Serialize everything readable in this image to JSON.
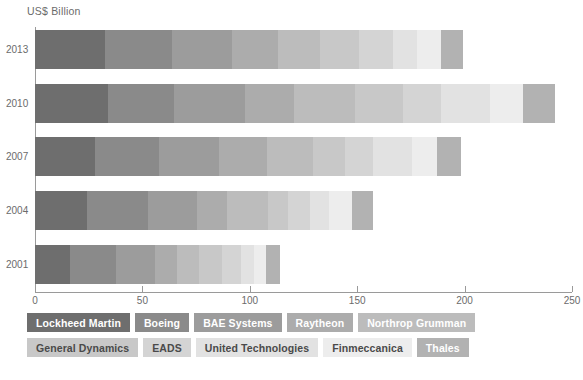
{
  "chart_data": {
    "type": "bar",
    "orientation": "horizontal",
    "stacked": true,
    "title": "US$ Billion",
    "xlabel": "",
    "ylabel": "",
    "xlim": [
      0,
      250
    ],
    "xticks": [
      0,
      50,
      100,
      150,
      200,
      250
    ],
    "xtick_labels": [
      "0",
      "50",
      "100",
      "150",
      "200",
      "250"
    ],
    "categories": [
      "2013",
      "2010",
      "2007",
      "2004",
      "2001"
    ],
    "grid": false,
    "legend_position": "bottom",
    "series": [
      {
        "name": "Lockheed Martin",
        "color": "#6e6e6e",
        "values": [
          32.5,
          34.0,
          28.0,
          24.0,
          16.5
        ]
      },
      {
        "name": "Boeing",
        "color": "#8a8a8a",
        "values": [
          31.5,
          30.5,
          29.5,
          28.5,
          21.0
        ]
      },
      {
        "name": "BAE Systems",
        "color": "#9c9c9c",
        "values": [
          27.5,
          33.5,
          28.0,
          23.0,
          18.5
        ]
      },
      {
        "name": "Raytheon",
        "color": "#acacac",
        "values": [
          21.5,
          22.5,
          22.5,
          14.0,
          10.0
        ]
      },
      {
        "name": "Northrop Grumman",
        "color": "#bcbcbc",
        "values": [
          19.5,
          28.5,
          21.5,
          19.0,
          10.5
        ]
      },
      {
        "name": "General Dynamics",
        "color": "#c8c8c8",
        "values": [
          18.5,
          22.5,
          15.0,
          9.5,
          10.5
        ]
      },
      {
        "name": "EADS",
        "color": "#d4d4d4",
        "values": [
          15.5,
          17.5,
          13.0,
          10.0,
          9.0
        ]
      },
      {
        "name": "United Technologies",
        "color": "#e2e2e2",
        "values": [
          11.5,
          23.0,
          18.0,
          9.0,
          6.0
        ]
      },
      {
        "name": "Finmeccanica",
        "color": "#ededed",
        "values": [
          11.0,
          15.0,
          11.5,
          10.5,
          5.5
        ]
      },
      {
        "name": "Thales",
        "color": "#b2b2b2",
        "values": [
          10.5,
          15.0,
          11.5,
          10.0,
          6.5
        ]
      }
    ],
    "totals": [
      199.5,
      242.0,
      198.5,
      157.5,
      114.0
    ]
  },
  "legend": {
    "rows": [
      [
        {
          "label": "Lockheed Martin",
          "swatch": "#6e6e6e",
          "text_color": "#ffffff"
        },
        {
          "label": "Boeing",
          "swatch": "#8a8a8a",
          "text_color": "#ffffff"
        },
        {
          "label": "BAE Systems",
          "swatch": "#9c9c9c",
          "text_color": "#ffffff"
        },
        {
          "label": "Raytheon",
          "swatch": "#acacac",
          "text_color": "#ffffff"
        },
        {
          "label": "Northrop Grumman",
          "swatch": "#bcbcbc",
          "text_color": "#ffffff"
        }
      ],
      [
        {
          "label": "General Dynamics",
          "swatch": "#c8c8c8",
          "text_color": "#4a4a4a"
        },
        {
          "label": "EADS",
          "swatch": "#d4d4d4",
          "text_color": "#4a4a4a"
        },
        {
          "label": "United Technologies",
          "swatch": "#e2e2e2",
          "text_color": "#4a4a4a"
        },
        {
          "label": "Finmeccanica",
          "swatch": "#ededed",
          "text_color": "#4a4a4a"
        },
        {
          "label": "Thales",
          "swatch": "#b2b2b2",
          "text_color": "#ffffff"
        }
      ]
    ]
  }
}
